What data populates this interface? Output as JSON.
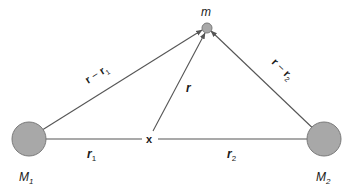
{
  "diagram": {
    "colors": {
      "line": "#555555",
      "mass_fill": "#a8a8a8",
      "mass_stroke": "#7a7a7a",
      "text": "#1a1a1a"
    },
    "nodes": {
      "M1": {
        "label": "M",
        "sub": "1",
        "cx": 29,
        "cy": 139,
        "r": 17
      },
      "M2": {
        "label": "M",
        "sub": "2",
        "cx": 324,
        "cy": 139,
        "r": 17
      },
      "m": {
        "label": "m",
        "cx": 207,
        "cy": 28,
        "r": 5
      },
      "origin": {
        "label": "x",
        "cx": 150,
        "cy": 139
      }
    },
    "vectors": {
      "r1": {
        "label": "r",
        "sub": "1",
        "from": "origin",
        "to": "M1"
      },
      "r2": {
        "label": "r",
        "sub": "2",
        "from": "origin",
        "to": "M2"
      },
      "r": {
        "label": "r",
        "from": "origin",
        "to": "m"
      },
      "r_minus_r1": {
        "label_main": "r",
        "op": " − ",
        "label_b": "r",
        "sub": "1",
        "from": "M1",
        "to": "m"
      },
      "r_minus_r2": {
        "label_main": "r",
        "op": " − ",
        "label_b": "r",
        "sub": "2",
        "from": "M2",
        "to": "m"
      }
    }
  }
}
